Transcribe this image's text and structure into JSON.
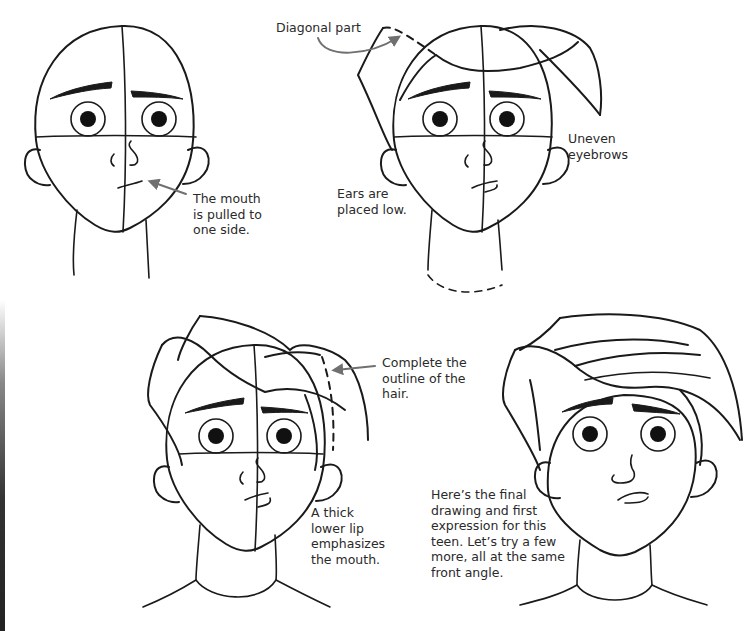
{
  "page": {
    "background": "#ffffff",
    "ink_color": "#1a1a1a",
    "arrow_color": "#707070"
  },
  "figures": [
    {
      "id": "step-1",
      "caption": "The mouth\nis pulled to\none side."
    },
    {
      "id": "step-2",
      "captions": {
        "diagonal_part": "Diagonal part",
        "uneven_eyebrows": "Uneven\neyebrows",
        "ears_low": "Ears are\nplaced low."
      }
    },
    {
      "id": "step-3",
      "captions": {
        "hair_outline": "Complete the\noutline of the\nhair.",
        "lower_lip": "A thick\nlower lip\nemphasizes\nthe mouth."
      }
    },
    {
      "id": "step-4",
      "caption": "Here’s the final\ndrawing and first\nexpression for this\nteen. Let’s try a few\nmore, all at the same\nfront angle."
    }
  ]
}
